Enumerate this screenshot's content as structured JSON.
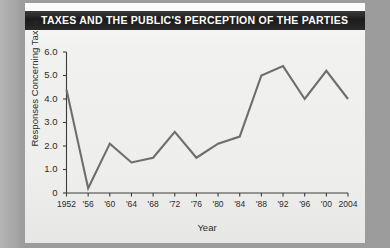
{
  "title": "TAXES AND THE PUBLIC'S PERCEPTION OF THE PARTIES",
  "colors": {
    "title_bar_bg": "#1b1b1b",
    "title_text": "#ffffff",
    "card_bg": "#f1f1ef",
    "page_bg": "#9c9c9c",
    "line": "#6e6e6e",
    "axis": "#3c3c3c",
    "tick_text": "#2b2b2b"
  },
  "chart_data": {
    "type": "line",
    "title": "TAXES AND THE PUBLIC'S PERCEPTION OF THE PARTIES",
    "xlabel": "Year",
    "ylabel": "Responses Concerning Taxes",
    "grid": false,
    "legend": false,
    "xlim": [
      1952,
      2004
    ],
    "ylim": [
      0,
      6
    ],
    "ytick_values": [
      0,
      1.0,
      2.0,
      3.0,
      4.0,
      5.0,
      6.0
    ],
    "ytick_labels": [
      "0",
      "1.0",
      "2.0",
      "3.0",
      "4.0",
      "5.0",
      "6.0"
    ],
    "xtick_values": [
      1952,
      1956,
      1960,
      1964,
      1968,
      1972,
      1976,
      1980,
      1984,
      1988,
      1992,
      1996,
      2000,
      2004
    ],
    "xtick_labels": [
      "1952",
      "'56",
      "'60",
      "'64",
      "'68",
      "'72",
      "'76",
      "'80",
      "'84",
      "'88",
      "'92",
      "'96",
      "'00",
      "2004"
    ],
    "x": [
      1952,
      1956,
      1960,
      1964,
      1968,
      1972,
      1976,
      1980,
      1984,
      1988,
      1992,
      1996,
      2000,
      2004
    ],
    "values": [
      4.4,
      0.2,
      2.1,
      1.3,
      1.5,
      2.6,
      1.5,
      2.1,
      2.4,
      5.0,
      5.4,
      4.0,
      5.2,
      4.0
    ],
    "series": [
      {
        "name": "Responses Concerning Taxes",
        "values": [
          4.4,
          0.2,
          2.1,
          1.3,
          1.5,
          2.6,
          1.5,
          2.1,
          2.4,
          5.0,
          5.4,
          4.0,
          5.2,
          4.0
        ]
      }
    ]
  }
}
